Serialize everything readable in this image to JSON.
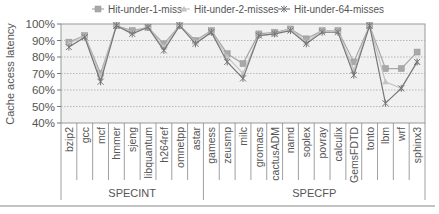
{
  "chart_data": {
    "type": "line",
    "title": "",
    "xlabel": "",
    "ylabel": "Cache acess latency",
    "ylim": [
      40,
      100
    ],
    "yticks": [
      "40%",
      "50%",
      "60%",
      "70%",
      "80%",
      "90%",
      "100%"
    ],
    "grid": true,
    "legend_position": "top",
    "categories": [
      "bzip2",
      "gcc",
      "mcf",
      "hmmer",
      "sjeng",
      "libquantum",
      "h264ref",
      "omnetpp",
      "astar",
      "gamess",
      "zeusmp",
      "milc",
      "gromacs",
      "cactusADM",
      "namd",
      "soplex",
      "povray",
      "calculix",
      "GemsFDTD",
      "tonto",
      "lbm",
      "wrf",
      "sphinx3"
    ],
    "groups": [
      {
        "name": "SPECINT",
        "start": 0,
        "end": 8
      },
      {
        "name": "SPECFP",
        "start": 9,
        "end": 22
      }
    ],
    "series": [
      {
        "name": "Hit-under-1-miss",
        "marker": "square",
        "color": "#a8a8a8",
        "values": [
          89,
          93,
          70,
          99,
          96,
          98,
          88,
          99,
          90,
          96,
          82,
          76,
          94,
          95,
          97,
          91,
          96,
          96,
          77,
          99,
          73,
          73,
          83
        ]
      },
      {
        "name": "Hit-under-2-misses",
        "marker": "triangle",
        "color": "#c4c4c4",
        "values": [
          88,
          93,
          68,
          99,
          95,
          98,
          86,
          99,
          89,
          95,
          80,
          70,
          93,
          94,
          97,
          89,
          96,
          96,
          72,
          99,
          65,
          61,
          77
        ]
      },
      {
        "name": "Hit-under-64-misses",
        "marker": "x",
        "color": "#777777",
        "values": [
          86,
          92,
          65,
          99,
          94,
          98,
          84,
          99,
          88,
          95,
          77,
          67,
          93,
          94,
          96,
          88,
          95,
          95,
          69,
          99,
          52,
          61,
          77
        ]
      }
    ]
  }
}
